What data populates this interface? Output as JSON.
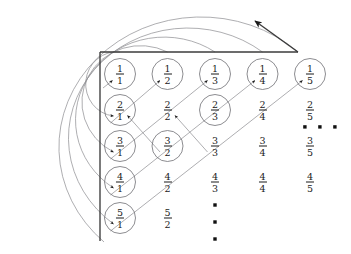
{
  "figure": {
    "width": 351,
    "height": 254,
    "background_color": "#ffffff",
    "axis_color": "#3b3b3b",
    "path_color": "#8e8e92",
    "circle_color": "#6f6f74",
    "arrow_color": "#1a1a1a",
    "text_color": "#1b1b1b"
  },
  "axes": {
    "origin_x": 100,
    "origin_y": 52,
    "horizontal_end_x": 298,
    "vertical_end_y": 241,
    "exit_arrow": {
      "from_x": 298,
      "from_y": 52,
      "to_x": 254,
      "to_y": 20,
      "label": "continue-diagonal-arrow"
    }
  },
  "grid": {
    "columns": 5,
    "rows": 5,
    "column_x": [
      120,
      167.5,
      215,
      262.5,
      310
    ],
    "row_y": [
      74,
      110,
      146,
      182,
      218
    ],
    "column_denominators": [
      1,
      2,
      3,
      4,
      5
    ],
    "row_numerators": [
      1,
      2,
      3,
      4,
      5
    ]
  },
  "cells": [
    {
      "row": 1,
      "col": 1,
      "numerator": "1",
      "denominator": "1",
      "circled": true
    },
    {
      "row": 1,
      "col": 2,
      "numerator": "1",
      "denominator": "2",
      "circled": true
    },
    {
      "row": 1,
      "col": 3,
      "numerator": "1",
      "denominator": "3",
      "circled": true
    },
    {
      "row": 1,
      "col": 4,
      "numerator": "1",
      "denominator": "4",
      "circled": true
    },
    {
      "row": 1,
      "col": 5,
      "numerator": "1",
      "denominator": "5",
      "circled": true
    },
    {
      "row": 2,
      "col": 1,
      "numerator": "2",
      "denominator": "1",
      "circled": true
    },
    {
      "row": 2,
      "col": 2,
      "numerator": "2",
      "denominator": "2",
      "circled": false
    },
    {
      "row": 2,
      "col": 3,
      "numerator": "2",
      "denominator": "3",
      "circled": true
    },
    {
      "row": 2,
      "col": 4,
      "numerator": "2",
      "denominator": "4",
      "circled": false
    },
    {
      "row": 2,
      "col": 5,
      "numerator": "2",
      "denominator": "5",
      "circled": false
    },
    {
      "row": 3,
      "col": 1,
      "numerator": "3",
      "denominator": "1",
      "circled": true
    },
    {
      "row": 3,
      "col": 2,
      "numerator": "3",
      "denominator": "2",
      "circled": true
    },
    {
      "row": 3,
      "col": 3,
      "numerator": "3",
      "denominator": "3",
      "circled": false
    },
    {
      "row": 3,
      "col": 4,
      "numerator": "3",
      "denominator": "4",
      "circled": false
    },
    {
      "row": 3,
      "col": 5,
      "numerator": "3",
      "denominator": "5",
      "circled": false
    },
    {
      "row": 4,
      "col": 1,
      "numerator": "4",
      "denominator": "1",
      "circled": true
    },
    {
      "row": 4,
      "col": 2,
      "numerator": "4",
      "denominator": "2",
      "circled": false
    },
    {
      "row": 4,
      "col": 3,
      "numerator": "4",
      "denominator": "3",
      "circled": false
    },
    {
      "row": 4,
      "col": 4,
      "numerator": "4",
      "denominator": "4",
      "circled": false
    },
    {
      "row": 4,
      "col": 5,
      "numerator": "4",
      "denominator": "5",
      "circled": false
    },
    {
      "row": 5,
      "col": 1,
      "numerator": "5",
      "denominator": "1",
      "circled": true
    },
    {
      "row": 5,
      "col": 2,
      "numerator": "5",
      "denominator": "2",
      "circled": false
    }
  ],
  "diagonals": [
    {
      "index": 1,
      "start_row": 1,
      "start_col": 1,
      "end_row": 1,
      "end_col": 1
    },
    {
      "index": 2,
      "start_row": 2,
      "start_col": 1,
      "end_row": 1,
      "end_col": 2
    },
    {
      "index": 3,
      "start_row": 3,
      "start_col": 1,
      "end_row": 1,
      "end_col": 3
    },
    {
      "index": 4,
      "start_row": 4,
      "start_col": 1,
      "end_row": 1,
      "end_col": 4
    },
    {
      "index": 5,
      "start_row": 5,
      "start_col": 1,
      "end_row": 1,
      "end_col": 5
    }
  ],
  "arcs": [
    {
      "index": 1,
      "from_axis_x": 120,
      "to_row": 2
    },
    {
      "index": 2,
      "from_axis_x": 167.5,
      "to_row": 3
    },
    {
      "index": 3,
      "from_axis_x": 215,
      "to_row": 4
    },
    {
      "index": 4,
      "from_axis_x": 262.5,
      "to_row": 5
    },
    {
      "index": 5,
      "from_axis_x": 298,
      "to_row": 6
    }
  ],
  "ellipses": {
    "horizontal": {
      "label": "horizontal-ellipsis",
      "y": 127,
      "dot_x": [
        305,
        320,
        335
      ],
      "meaning": "columns continue to the right"
    },
    "vertical": {
      "label": "vertical-ellipsis",
      "x": 215,
      "dot_y": [
        205,
        222,
        239
      ],
      "meaning": "rows continue downward"
    }
  }
}
